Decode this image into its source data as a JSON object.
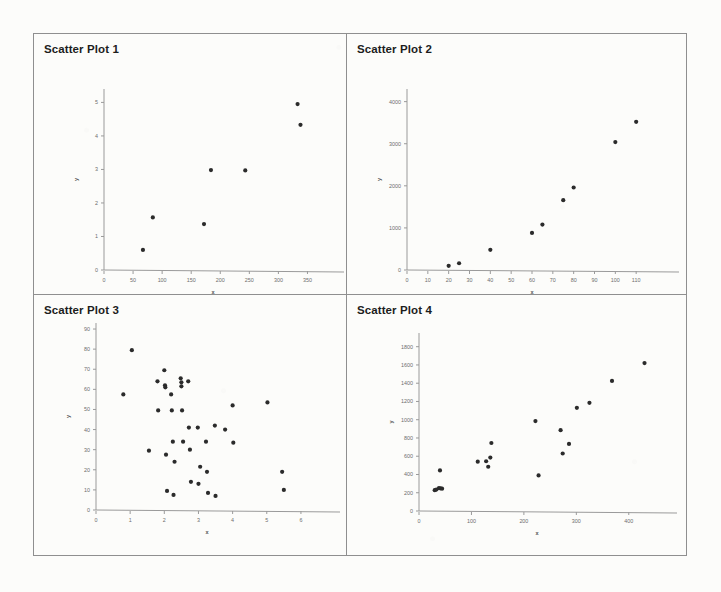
{
  "document": {
    "background_color": "#fcfcfa",
    "border_color": "#8f8f8f",
    "point_color": "#2b2b2b",
    "axis_color": "#9a9a9a",
    "title_color": "#1d1d1d"
  },
  "panels": [
    {
      "title": "Scatter Plot 1"
    },
    {
      "title": "Scatter Plot 2"
    },
    {
      "title": "Scatter Plot 3"
    },
    {
      "title": "Scatter Plot 4"
    }
  ],
  "chart_data": [
    {
      "type": "scatter",
      "title": "Scatter Plot 1",
      "xlabel": "x",
      "ylabel": "y",
      "xlim": [
        0,
        375
      ],
      "ylim": [
        0,
        5.4
      ],
      "xticks": [
        0,
        50,
        100,
        150,
        200,
        250,
        300,
        350
      ],
      "yticks": [
        0,
        1,
        2,
        3,
        4,
        5
      ],
      "grid": false,
      "legend": "none",
      "points": [
        {
          "x": 67,
          "y": 0.6
        },
        {
          "x": 84,
          "y": 1.57
        },
        {
          "x": 172,
          "y": 1.37
        },
        {
          "x": 184,
          "y": 2.98
        },
        {
          "x": 243,
          "y": 2.97
        },
        {
          "x": 333,
          "y": 4.95
        },
        {
          "x": 338,
          "y": 4.33
        }
      ]
    },
    {
      "type": "scatter",
      "title": "Scatter Plot 2",
      "xlabel": "x",
      "ylabel": "y",
      "xlim": [
        0,
        120
      ],
      "ylim": [
        0,
        4300
      ],
      "xticks": [
        0,
        10,
        20,
        30,
        40,
        50,
        60,
        70,
        80,
        90,
        100,
        110
      ],
      "yticks": [
        0,
        1000,
        2000,
        3000,
        4000
      ],
      "grid": false,
      "legend": "none",
      "points": [
        {
          "x": 20,
          "y": 100
        },
        {
          "x": 25,
          "y": 160
        },
        {
          "x": 40,
          "y": 480
        },
        {
          "x": 60,
          "y": 880
        },
        {
          "x": 65,
          "y": 1080
        },
        {
          "x": 75,
          "y": 1660
        },
        {
          "x": 80,
          "y": 1960
        },
        {
          "x": 100,
          "y": 3040
        },
        {
          "x": 110,
          "y": 3520
        }
      ]
    },
    {
      "type": "scatter",
      "title": "Scatter Plot 3",
      "xlabel": "x",
      "ylabel": "y",
      "xlim": [
        0,
        6.5
      ],
      "ylim": [
        0,
        93
      ],
      "xticks": [
        0,
        1,
        2,
        3,
        4,
        5,
        6
      ],
      "yticks": [
        0,
        10,
        20,
        30,
        40,
        50,
        60,
        70,
        80,
        90
      ],
      "grid": false,
      "legend": "none",
      "points": [
        {
          "x": 0.8,
          "y": 57.5
        },
        {
          "x": 1.05,
          "y": 79.5
        },
        {
          "x": 1.55,
          "y": 29.5
        },
        {
          "x": 1.8,
          "y": 64.0
        },
        {
          "x": 1.82,
          "y": 49.5
        },
        {
          "x": 2.0,
          "y": 69.5
        },
        {
          "x": 2.02,
          "y": 62.0
        },
        {
          "x": 2.03,
          "y": 61.0
        },
        {
          "x": 2.05,
          "y": 27.5
        },
        {
          "x": 2.08,
          "y": 9.5
        },
        {
          "x": 2.2,
          "y": 57.5
        },
        {
          "x": 2.22,
          "y": 49.5
        },
        {
          "x": 2.25,
          "y": 34.0
        },
        {
          "x": 2.27,
          "y": 7.5
        },
        {
          "x": 2.3,
          "y": 24.0
        },
        {
          "x": 2.48,
          "y": 65.5
        },
        {
          "x": 2.5,
          "y": 63.5
        },
        {
          "x": 2.5,
          "y": 61.5
        },
        {
          "x": 2.52,
          "y": 49.5
        },
        {
          "x": 2.55,
          "y": 34.0
        },
        {
          "x": 2.7,
          "y": 64.0
        },
        {
          "x": 2.72,
          "y": 41.0
        },
        {
          "x": 2.75,
          "y": 30.0
        },
        {
          "x": 2.78,
          "y": 14.0
        },
        {
          "x": 2.98,
          "y": 41.0
        },
        {
          "x": 3.0,
          "y": 13.0
        },
        {
          "x": 3.05,
          "y": 21.5
        },
        {
          "x": 3.22,
          "y": 34.0
        },
        {
          "x": 3.25,
          "y": 19.0
        },
        {
          "x": 3.28,
          "y": 8.5
        },
        {
          "x": 3.48,
          "y": 42.0
        },
        {
          "x": 3.5,
          "y": 7.0
        },
        {
          "x": 3.78,
          "y": 40.0
        },
        {
          "x": 4.0,
          "y": 52.0
        },
        {
          "x": 4.02,
          "y": 33.5
        },
        {
          "x": 5.02,
          "y": 53.5
        },
        {
          "x": 5.45,
          "y": 19.0
        },
        {
          "x": 5.5,
          "y": 10.0
        }
      ]
    },
    {
      "type": "scatter",
      "title": "Scatter Plot 4",
      "xlabel": "x",
      "ylabel": "y",
      "xlim": [
        0,
        450
      ],
      "ylim": [
        0,
        1950
      ],
      "xticks": [
        0,
        100,
        200,
        300,
        400
      ],
      "yticks": [
        0,
        200,
        400,
        600,
        800,
        1000,
        1200,
        1400,
        1600,
        1800
      ],
      "grid": false,
      "legend": "none",
      "points": [
        {
          "x": 30,
          "y": 228
        },
        {
          "x": 33,
          "y": 235
        },
        {
          "x": 38,
          "y": 250
        },
        {
          "x": 41,
          "y": 248
        },
        {
          "x": 44,
          "y": 245
        },
        {
          "x": 40,
          "y": 445
        },
        {
          "x": 112,
          "y": 540
        },
        {
          "x": 128,
          "y": 545
        },
        {
          "x": 132,
          "y": 485
        },
        {
          "x": 136,
          "y": 585
        },
        {
          "x": 138,
          "y": 745
        },
        {
          "x": 222,
          "y": 985
        },
        {
          "x": 228,
          "y": 390
        },
        {
          "x": 270,
          "y": 885
        },
        {
          "x": 274,
          "y": 630
        },
        {
          "x": 286,
          "y": 735
        },
        {
          "x": 301,
          "y": 1130
        },
        {
          "x": 325,
          "y": 1185
        },
        {
          "x": 368,
          "y": 1425
        },
        {
          "x": 430,
          "y": 1620
        }
      ]
    }
  ]
}
